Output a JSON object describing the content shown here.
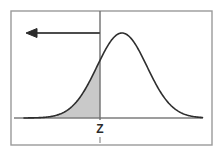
{
  "figure": {
    "name": "normal-distribution-left-tail-diagram",
    "background_color": "#ffffff",
    "frame": {
      "color": "#9a9a9a",
      "line_width": 1.4,
      "x": 11,
      "y": 11,
      "width": 201,
      "height": 134
    },
    "axis": {
      "color": "#7d7d7d",
      "line_width": 1.3,
      "baseline_y": 118,
      "x_start": 14,
      "x_end": 203
    },
    "vertical_line": {
      "name": "z-vertical-line",
      "color": "#6f6f6f",
      "line_width": 1.4,
      "x": 100,
      "y_top": 11,
      "y_bottom": 120
    },
    "curve": {
      "name": "normal-curve",
      "color": "#2e2e2e",
      "line_width": 1.6,
      "peak_x": 122,
      "peak_y": 33,
      "left_tail_x": 24,
      "right_tail_x": 203,
      "mean": 122,
      "sigma": 25
    },
    "shaded_area": {
      "name": "left-tail-shaded-region",
      "fill_color": "#c9c9c9",
      "from_x": 24,
      "to_x": 100,
      "label": "P(X < Z)"
    },
    "arrow": {
      "name": "left-direction-arrow",
      "color": "#4c4c4c",
      "line_width": 2.2,
      "y": 33,
      "x_tail": 100,
      "x_head": 26,
      "head_width": 11,
      "head_height": 9,
      "direction": "left"
    },
    "z_label": {
      "name": "z-axis-label",
      "text": "Z",
      "x": 100,
      "y": 133,
      "color": "#2b2b2b",
      "font_size": 12
    },
    "z_tick": {
      "name": "z-tick-mark",
      "color": "#8d8d8d",
      "x": 100,
      "y_top": 137,
      "y_bottom": 143,
      "line_width": 1.2
    }
  }
}
